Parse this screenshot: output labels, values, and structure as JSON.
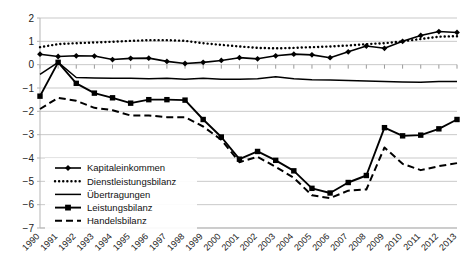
{
  "chart_data": {
    "type": "line",
    "title": "",
    "subtitle": "",
    "xlabel": "",
    "ylabel": "",
    "grid": true,
    "legend_position": "inside-lower-left",
    "ylim": [
      -7,
      2
    ],
    "yticks": [
      2,
      1,
      0,
      -1,
      -2,
      -3,
      -4,
      -5,
      -6,
      -7
    ],
    "ytick_labels": [
      "2",
      "1",
      "0",
      "−1",
      "−2",
      "−3",
      "−4",
      "−5",
      "−6",
      "−7"
    ],
    "categories": [
      "1990",
      "1991",
      "1992",
      "1993",
      "1994",
      "1995",
      "1996",
      "1997",
      "1998",
      "1999",
      "2000",
      "2001",
      "2002",
      "2003",
      "2004",
      "2005",
      "2006",
      "2007",
      "2008",
      "2009",
      "2010",
      "2011",
      "2012",
      "2013"
    ],
    "series": [
      {
        "name": "Kapitaleinkommen",
        "style": "solid-diamond",
        "values": [
          0.45,
          0.35,
          0.38,
          0.37,
          0.22,
          0.27,
          0.28,
          0.14,
          0.05,
          0.1,
          0.18,
          0.3,
          0.25,
          0.38,
          0.45,
          0.42,
          0.3,
          0.55,
          0.8,
          0.7,
          1.0,
          1.25,
          1.42,
          1.38
        ]
      },
      {
        "name": "Dienstleistungsbilanz",
        "style": "dotted",
        "values": [
          0.75,
          0.88,
          0.92,
          0.95,
          0.98,
          1.02,
          1.05,
          1.05,
          1.02,
          0.92,
          0.85,
          0.78,
          0.72,
          0.7,
          0.72,
          0.75,
          0.78,
          0.82,
          0.88,
          0.92,
          1.0,
          1.1,
          1.2,
          1.22
        ]
      },
      {
        "name": "Übertragungen",
        "style": "solid-plain",
        "values": [
          -0.42,
          0.1,
          -0.55,
          -0.57,
          -0.58,
          -0.58,
          -0.6,
          -0.58,
          -0.62,
          -0.58,
          -0.62,
          -0.62,
          -0.6,
          -0.52,
          -0.6,
          -0.65,
          -0.66,
          -0.68,
          -0.7,
          -0.72,
          -0.74,
          -0.75,
          -0.72,
          -0.72
        ]
      },
      {
        "name": "Leistungsbilanz",
        "style": "solid-square",
        "values": [
          -1.35,
          0.1,
          -0.8,
          -1.22,
          -1.42,
          -1.65,
          -1.5,
          -1.5,
          -1.52,
          -2.35,
          -3.1,
          -4.05,
          -3.72,
          -4.1,
          -4.55,
          -5.3,
          -5.5,
          -5.05,
          -4.75,
          -2.7,
          -3.05,
          -3.02,
          -2.75,
          -2.35
        ]
      },
      {
        "name": "Handelsbilanz",
        "style": "dashed",
        "values": [
          -1.9,
          -1.42,
          -1.55,
          -1.85,
          -1.95,
          -2.18,
          -2.18,
          -2.25,
          -2.25,
          -2.65,
          -3.22,
          -4.18,
          -3.95,
          -4.38,
          -4.85,
          -5.6,
          -5.72,
          -5.4,
          -5.35,
          -3.55,
          -4.25,
          -4.52,
          -4.35,
          -4.22
        ]
      }
    ],
    "legend": [
      {
        "label": "Kapitaleinkommen",
        "style": "solid-diamond"
      },
      {
        "label": "Dienstleistungsbilanz",
        "style": "dotted"
      },
      {
        "label": "Übertragungen",
        "style": "solid-plain"
      },
      {
        "label": "Leistungsbilanz",
        "style": "solid-square"
      },
      {
        "label": "Handelsbilanz",
        "style": "dashed"
      }
    ],
    "colors": {
      "series": "#000000",
      "gridline": "#c9c9c9",
      "axis": "#b5b5b5",
      "background": "#ffffff",
      "text": "#1a1a1a"
    }
  }
}
